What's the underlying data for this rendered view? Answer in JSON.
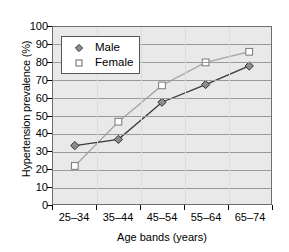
{
  "chart_data": {
    "type": "line",
    "title": "",
    "xlabel": "Age bands (years)",
    "ylabel": "Hypertension prevalence (%)",
    "categories": [
      "25–34",
      "35–44",
      "45–54",
      "55–64",
      "65–74"
    ],
    "ylim": [
      0,
      100
    ],
    "yticks": [
      0,
      10,
      20,
      30,
      40,
      50,
      60,
      70,
      80,
      90,
      100
    ],
    "ytick_labels": [
      "0",
      "10",
      "20",
      "30",
      "40",
      "50",
      "60",
      "70",
      "80",
      "90",
      "100"
    ],
    "grid": "horizontal",
    "legend_position": "upper-left-inside",
    "series": [
      {
        "name": "Male",
        "marker": "diamond-filled",
        "color": "#3a3a3a",
        "marker_fill": "#8c8c8c",
        "values": [
          33,
          36.5,
          57.5,
          67.5,
          78
        ]
      },
      {
        "name": "Female",
        "marker": "square-open",
        "color": "#a8a8a8",
        "marker_fill": "#ffffff",
        "values": [
          21.5,
          46.5,
          67,
          80,
          86
        ]
      }
    ],
    "plot_background": "#e9e9e9",
    "gridline_color": "#9a9a9a",
    "axis_color": "#6e6e6e"
  }
}
